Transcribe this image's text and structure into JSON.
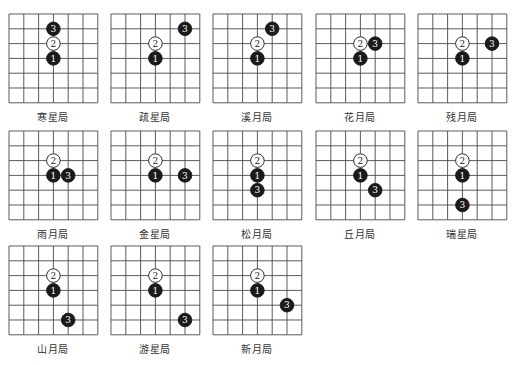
{
  "grid": {
    "columns": 6,
    "rows": 6,
    "cell": 14.8,
    "line_color": "#4a4a4a"
  },
  "colors": {
    "black_stone": "#1a1a1a",
    "white_stone": "#ffffff",
    "black_numeral": "#ffffff",
    "white_numeral": "#1a1a1a"
  },
  "boards": [
    {
      "name": "寒星局",
      "x": 8,
      "y": 13,
      "stones": [
        {
          "n": "1",
          "c": "b",
          "col": 3,
          "row": 3
        },
        {
          "n": "2",
          "c": "w",
          "col": 3,
          "row": 2
        },
        {
          "n": "3",
          "c": "b",
          "col": 3,
          "row": 1
        }
      ]
    },
    {
      "name": "疏星局",
      "x": 110,
      "y": 13,
      "stones": [
        {
          "n": "1",
          "c": "b",
          "col": 3,
          "row": 3
        },
        {
          "n": "2",
          "c": "w",
          "col": 3,
          "row": 2
        },
        {
          "n": "3",
          "c": "b",
          "col": 5,
          "row": 1
        }
      ]
    },
    {
      "name": "溪月局",
      "x": 212,
      "y": 13,
      "stones": [
        {
          "n": "1",
          "c": "b",
          "col": 3,
          "row": 3
        },
        {
          "n": "2",
          "c": "w",
          "col": 3,
          "row": 2
        },
        {
          "n": "3",
          "c": "b",
          "col": 4,
          "row": 1
        }
      ]
    },
    {
      "name": "花月局",
      "x": 315,
      "y": 13,
      "stones": [
        {
          "n": "1",
          "c": "b",
          "col": 3,
          "row": 3
        },
        {
          "n": "2",
          "c": "w",
          "col": 3,
          "row": 2
        },
        {
          "n": "3",
          "c": "b",
          "col": 4,
          "row": 2
        }
      ]
    },
    {
      "name": "残月局",
      "x": 417,
      "y": 13,
      "stones": [
        {
          "n": "1",
          "c": "b",
          "col": 3,
          "row": 3
        },
        {
          "n": "2",
          "c": "w",
          "col": 3,
          "row": 2
        },
        {
          "n": "3",
          "c": "b",
          "col": 5,
          "row": 2
        }
      ]
    },
    {
      "name": "雨月局",
      "x": 8,
      "y": 130,
      "stones": [
        {
          "n": "1",
          "c": "b",
          "col": 3,
          "row": 3
        },
        {
          "n": "2",
          "c": "w",
          "col": 3,
          "row": 2
        },
        {
          "n": "3",
          "c": "b",
          "col": 4,
          "row": 3
        }
      ]
    },
    {
      "name": "金星局",
      "x": 110,
      "y": 130,
      "stones": [
        {
          "n": "1",
          "c": "b",
          "col": 3,
          "row": 3
        },
        {
          "n": "2",
          "c": "w",
          "col": 3,
          "row": 2
        },
        {
          "n": "3",
          "c": "b",
          "col": 5,
          "row": 3
        }
      ]
    },
    {
      "name": "松月局",
      "x": 212,
      "y": 130,
      "stones": [
        {
          "n": "1",
          "c": "b",
          "col": 3,
          "row": 3
        },
        {
          "n": "2",
          "c": "w",
          "col": 3,
          "row": 2
        },
        {
          "n": "3",
          "c": "b",
          "col": 3,
          "row": 4
        }
      ]
    },
    {
      "name": "丘月局",
      "x": 315,
      "y": 130,
      "stones": [
        {
          "n": "1",
          "c": "b",
          "col": 3,
          "row": 3
        },
        {
          "n": "2",
          "c": "w",
          "col": 3,
          "row": 2
        },
        {
          "n": "3",
          "c": "b",
          "col": 4,
          "row": 4
        }
      ]
    },
    {
      "name": "瑞星局",
      "x": 417,
      "y": 130,
      "stones": [
        {
          "n": "1",
          "c": "b",
          "col": 3,
          "row": 3
        },
        {
          "n": "2",
          "c": "w",
          "col": 3,
          "row": 2
        },
        {
          "n": "3",
          "c": "b",
          "col": 3,
          "row": 5
        }
      ]
    },
    {
      "name": "山月局",
      "x": 8,
      "y": 245,
      "stones": [
        {
          "n": "1",
          "c": "b",
          "col": 3,
          "row": 3
        },
        {
          "n": "2",
          "c": "w",
          "col": 3,
          "row": 2
        },
        {
          "n": "3",
          "c": "b",
          "col": 4,
          "row": 5
        }
      ]
    },
    {
      "name": "游星局",
      "x": 110,
      "y": 245,
      "stones": [
        {
          "n": "1",
          "c": "b",
          "col": 3,
          "row": 3
        },
        {
          "n": "2",
          "c": "w",
          "col": 3,
          "row": 2
        },
        {
          "n": "3",
          "c": "b",
          "col": 5,
          "row": 5
        }
      ]
    },
    {
      "name": "新月局",
      "x": 212,
      "y": 245,
      "stones": [
        {
          "n": "1",
          "c": "b",
          "col": 3,
          "row": 3
        },
        {
          "n": "2",
          "c": "w",
          "col": 3,
          "row": 2
        },
        {
          "n": "3",
          "c": "b",
          "col": 5,
          "row": 4
        }
      ]
    }
  ]
}
